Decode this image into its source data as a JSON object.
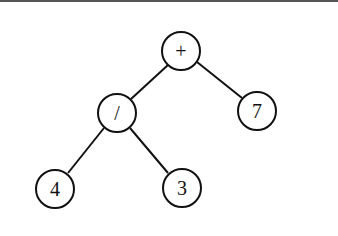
{
  "diagram": {
    "type": "expression-tree",
    "nodes": [
      {
        "id": "root",
        "label": "+",
        "x": 181,
        "y": 51
      },
      {
        "id": "div",
        "label": "/",
        "x": 117,
        "y": 113
      },
      {
        "id": "seven",
        "label": "7",
        "x": 257,
        "y": 111
      },
      {
        "id": "four",
        "label": "4",
        "x": 55,
        "y": 189
      },
      {
        "id": "three",
        "label": "3",
        "x": 182,
        "y": 188
      }
    ],
    "edges": [
      {
        "from": "root",
        "to": "div"
      },
      {
        "from": "root",
        "to": "seven"
      },
      {
        "from": "div",
        "to": "four"
      },
      {
        "from": "div",
        "to": "three"
      }
    ],
    "node_radius": 19,
    "stroke_color": "#111111",
    "background": "#ffffff"
  }
}
